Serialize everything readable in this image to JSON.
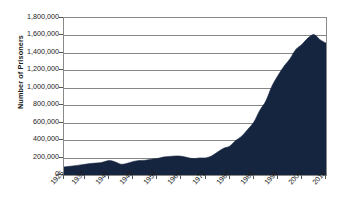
{
  "chart_data": {
    "type": "area",
    "title": "",
    "xlabel": "",
    "ylabel": "Number of Prisoners",
    "ylim": [
      0,
      1800000
    ],
    "xlim": [
      1925,
      2012
    ],
    "grid": true,
    "legend": "none",
    "series_color": "#16253f",
    "gridline_color": "#868686",
    "axis_color": "#8a8a8a",
    "ytick_labels": [
      "1,800,000",
      "1,600,000",
      "1,400,000",
      "1,200,000",
      "1,000,000",
      "800,000",
      "600,000",
      "400,000",
      "200,000",
      "0"
    ],
    "ytick_values": [
      1800000,
      1600000,
      1400000,
      1200000,
      1000000,
      800000,
      600000,
      400000,
      200000,
      0
    ],
    "xtick_labels": [
      "1925",
      "1932",
      "1940",
      "1948",
      "1956",
      "1964",
      "1972",
      "1980",
      "1988",
      "1996",
      "2004",
      "2012"
    ],
    "xtick_values": [
      1925,
      1932,
      1940,
      1948,
      1956,
      1964,
      1972,
      1980,
      1988,
      1996,
      2004,
      2012
    ],
    "x": [
      1925,
      1928,
      1931,
      1934,
      1937,
      1940,
      1942,
      1944,
      1946,
      1948,
      1950,
      1952,
      1954,
      1956,
      1958,
      1960,
      1962,
      1964,
      1966,
      1968,
      1970,
      1972,
      1974,
      1976,
      1978,
      1980,
      1982,
      1984,
      1986,
      1988,
      1990,
      1992,
      1994,
      1996,
      1998,
      2000,
      2002,
      2004,
      2006,
      2008,
      2010,
      2012
    ],
    "values": [
      92000,
      104000,
      118000,
      133000,
      140000,
      165000,
      150000,
      123000,
      134000,
      155000,
      166000,
      169000,
      182000,
      189000,
      206000,
      213000,
      218000,
      215000,
      200000,
      188000,
      196000,
      196000,
      218000,
      263000,
      307000,
      330000,
      395000,
      445000,
      523000,
      604000,
      740000,
      847000,
      1016000,
      1138000,
      1245000,
      1331000,
      1440000,
      1497000,
      1570000,
      1610000,
      1552000,
      1512000
    ]
  }
}
